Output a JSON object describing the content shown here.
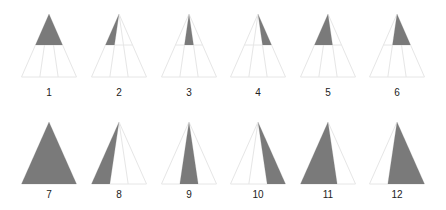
{
  "colors": {
    "fill": "#7a7a7a",
    "outline": "#e6e6e6",
    "label": "#222222",
    "background": "#ffffff"
  },
  "layout": {
    "half_width": 27.5,
    "rows": [
      {
        "apex_y": 14,
        "mid_y": 45,
        "base_y": 77,
        "label_y": 87,
        "fill_to": "mid"
      },
      {
        "apex_y": 122,
        "mid_y": 153,
        "base_y": 184,
        "label_y": 189,
        "fill_to": "base"
      }
    ],
    "column_apex_x": [
      49,
      119,
      189,
      258,
      328,
      397
    ]
  },
  "figures": [
    {
      "label": "1",
      "row": 0,
      "col": 0,
      "fill_region": [
        0,
        3
      ]
    },
    {
      "label": "2",
      "row": 0,
      "col": 1,
      "fill_region": [
        0,
        1
      ]
    },
    {
      "label": "3",
      "row": 0,
      "col": 2,
      "fill_region": [
        1,
        2
      ]
    },
    {
      "label": "4",
      "row": 0,
      "col": 3,
      "fill_region": [
        2,
        3
      ]
    },
    {
      "label": "5",
      "row": 0,
      "col": 4,
      "fill_region": [
        0,
        2
      ]
    },
    {
      "label": "6",
      "row": 0,
      "col": 5,
      "fill_region": [
        1,
        3
      ]
    },
    {
      "label": "7",
      "row": 1,
      "col": 0,
      "fill_region": [
        0,
        3
      ]
    },
    {
      "label": "8",
      "row": 1,
      "col": 1,
      "fill_region": [
        0,
        1
      ]
    },
    {
      "label": "9",
      "row": 1,
      "col": 2,
      "fill_region": [
        1,
        2
      ]
    },
    {
      "label": "10",
      "row": 1,
      "col": 3,
      "fill_region": [
        2,
        3
      ]
    },
    {
      "label": "11",
      "row": 1,
      "col": 4,
      "fill_region": [
        0,
        2
      ]
    },
    {
      "label": "12",
      "row": 1,
      "col": 5,
      "fill_region": [
        1,
        3
      ]
    }
  ]
}
